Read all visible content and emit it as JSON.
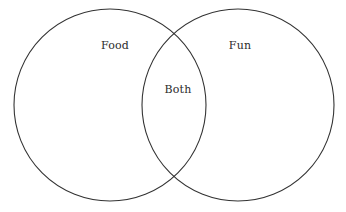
{
  "diagram": {
    "type": "venn",
    "background_color": "#ffffff",
    "stroke_color": "#333333",
    "text_color": "#2b2b2b",
    "sets": [
      {
        "id": "left",
        "label": "Food",
        "label_x": 115,
        "label_y": 45,
        "center_x": 110,
        "center_y": 105,
        "radius": 96
      },
      {
        "id": "right",
        "label": "Fun",
        "label_x": 240,
        "label_y": 45,
        "center_x": 238,
        "center_y": 105,
        "radius": 96
      }
    ],
    "intersection": {
      "id": "both",
      "label": "Both",
      "label_x": 178,
      "label_y": 89
    }
  }
}
